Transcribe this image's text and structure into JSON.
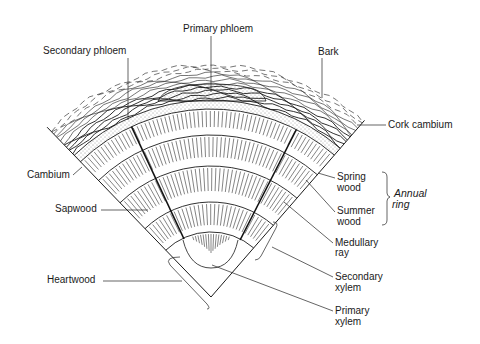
{
  "diagram": {
    "colors": {
      "ink": "#1a1a1a",
      "background": "#ffffff"
    },
    "labels": {
      "primary_phloem": "Primary phloem",
      "secondary_phloem": "Secondary phloem",
      "bark": "Bark",
      "cork_cambium": "Cork cambium",
      "cambium": "Cambium",
      "sapwood": "Sapwood",
      "heartwood": "Heartwood",
      "spring_wood_1": "Spring",
      "spring_wood_2": "wood",
      "summer_wood_1": "Summer",
      "summer_wood_2": "wood",
      "annual_ring_1": "Annual",
      "annual_ring_2": "ring",
      "medullary_ray_1": "Medullary",
      "medullary_ray_2": "ray",
      "secondary_xylem_1": "Secondary",
      "secondary_xylem_2": "xylem",
      "primary_xylem_1": "Primary",
      "primary_xylem_2": "xylem"
    }
  }
}
